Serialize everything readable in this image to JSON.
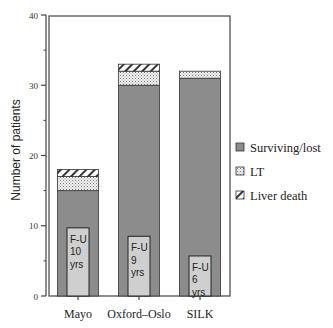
{
  "chart_data": {
    "type": "bar",
    "stacked": true,
    "title": "",
    "xlabel": "",
    "ylabel": "Number of patients",
    "ylim": [
      0,
      40
    ],
    "yticks_major": [
      0,
      10,
      20,
      30,
      40
    ],
    "yticks_minor": [
      5,
      15,
      25,
      35
    ],
    "grid": false,
    "legend_position": "right",
    "categories": [
      "Mayo",
      "Oxford–Oslo",
      "SILK"
    ],
    "series": [
      {
        "name": "Surviving/lost",
        "values": [
          15,
          30,
          31
        ],
        "pattern": "solid",
        "color": "#8c8c8c"
      },
      {
        "name": "LT",
        "values": [
          2,
          2,
          1
        ],
        "pattern": "dots",
        "color": "#e0e0e0"
      },
      {
        "name": "Liver death",
        "values": [
          1,
          1,
          0
        ],
        "pattern": "hatch",
        "color": "#ffffff"
      }
    ],
    "annotations": [
      {
        "category": "Mayo",
        "lines": [
          "F-U",
          "10",
          "yrs"
        ],
        "box_top_value": 9.7
      },
      {
        "category": "Oxford–Oslo",
        "lines": [
          "F-U",
          "9",
          "yrs"
        ],
        "box_top_value": 8.5
      },
      {
        "category": "SILK",
        "lines": [
          "F-U",
          "6",
          "yrs"
        ],
        "box_top_value": 5.7
      }
    ]
  },
  "legend": {
    "items": [
      {
        "label": "Surviving/lost",
        "pattern": "solid"
      },
      {
        "label": "LT",
        "pattern": "dots"
      },
      {
        "label": "Liver death",
        "pattern": "hatch"
      }
    ]
  },
  "colors": {
    "surviving": "#8c8c8c",
    "fu_box": "#cfcfcf",
    "axis": "#444444"
  }
}
